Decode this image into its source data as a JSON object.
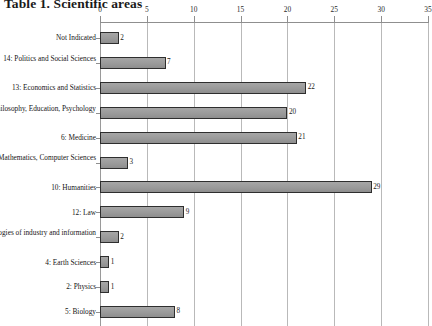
{
  "title": "Table 1. Scientific areas",
  "chart_data": {
    "type": "bar",
    "orientation": "horizontal",
    "title": "Table 1. Scientific areas",
    "xlabel": "",
    "ylabel": "",
    "xlim": [
      0,
      35
    ],
    "xticks": [
      0,
      5,
      10,
      15,
      20,
      25,
      30,
      35
    ],
    "grid": true,
    "legend": null,
    "value_labels": true,
    "categories": [
      "Not Indicated",
      "14: Politics and Social Sciences",
      "13: Economics and Statistics",
      "11: History, Philosophy, Education, Psychology",
      "6: Medicine",
      "1: Mathematics, Computer Sciences",
      "10: Humanities",
      "12: Law",
      "9: Technologies of industry and information",
      "4: Earth Sciences",
      "2: Physics",
      "5: Biology"
    ],
    "values": [
      2,
      7,
      22,
      20,
      21,
      3,
      29,
      9,
      2,
      1,
      1,
      8
    ],
    "bar_color": "#9b9b9b",
    "bar_border_color": "#2e2e2e",
    "gridline_color": "#b9b9b9",
    "axis_color": "#8f8f8f"
  }
}
